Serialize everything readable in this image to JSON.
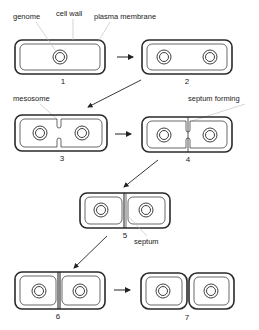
{
  "diagram": {
    "labels": {
      "genome": "genome",
      "cell_wall": "cell wall",
      "plasma_membrane": "plasma membrane",
      "mesosome": "mesosome",
      "septum_forming": "septum forming",
      "septum": "septum"
    },
    "stages": [
      {
        "number": "1",
        "description": "single cell with one genome"
      },
      {
        "number": "2",
        "description": "elongated cell, genome replicated"
      },
      {
        "number": "3",
        "description": "mesosome invagination"
      },
      {
        "number": "4",
        "description": "septum forming"
      },
      {
        "number": "5",
        "description": "septum complete"
      },
      {
        "number": "6",
        "description": "cell wall forms across septum"
      },
      {
        "number": "7",
        "description": "two daughter cells separate"
      }
    ],
    "colors": {
      "line": "#2a2a2a",
      "pointer": "#bbbbbb",
      "background": "#ffffff"
    }
  }
}
